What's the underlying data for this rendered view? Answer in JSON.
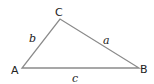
{
  "diagram": {
    "type": "triangle",
    "stroke_color": "#8a8a8a",
    "label_color": "#222222",
    "vertices": [
      {
        "name": "A",
        "x": 22,
        "y": 68,
        "label_x": 11,
        "label_y": 74
      },
      {
        "name": "B",
        "x": 139,
        "y": 68,
        "label_x": 140,
        "label_y": 73
      },
      {
        "name": "C",
        "x": 60,
        "y": 19,
        "label_x": 55,
        "label_y": 16
      }
    ],
    "sides": [
      {
        "name": "a",
        "label_x": 103,
        "label_y": 44
      },
      {
        "name": "b",
        "label_x": 29,
        "label_y": 42
      },
      {
        "name": "c",
        "label_x": 72,
        "label_y": 82
      }
    ]
  }
}
